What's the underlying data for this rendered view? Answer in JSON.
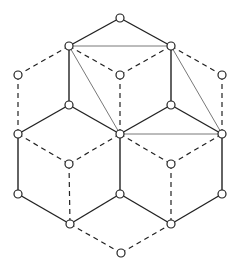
{
  "diagram": {
    "type": "graph",
    "node_radius": 4,
    "colors": {
      "stroke": "#222222",
      "thin_stroke": "#555555",
      "node_fill": "#ffffff",
      "background": "#ffffff"
    },
    "nodes": [
      {
        "id": 0,
        "x": 120,
        "y": 18
      },
      {
        "id": 1,
        "x": 69,
        "y": 46
      },
      {
        "id": 2,
        "x": 171,
        "y": 46
      },
      {
        "id": 3,
        "x": 18,
        "y": 75
      },
      {
        "id": 4,
        "x": 120,
        "y": 75
      },
      {
        "id": 5,
        "x": 222,
        "y": 75
      },
      {
        "id": 6,
        "x": 69,
        "y": 105
      },
      {
        "id": 7,
        "x": 171,
        "y": 105
      },
      {
        "id": 8,
        "x": 18,
        "y": 134
      },
      {
        "id": 9,
        "x": 120,
        "y": 134
      },
      {
        "id": 10,
        "x": 222,
        "y": 134
      },
      {
        "id": 11,
        "x": 69,
        "y": 164
      },
      {
        "id": 12,
        "x": 171,
        "y": 164
      },
      {
        "id": 13,
        "x": 18,
        "y": 194
      },
      {
        "id": 14,
        "x": 120,
        "y": 194
      },
      {
        "id": 15,
        "x": 222,
        "y": 194
      },
      {
        "id": 16,
        "x": 70,
        "y": 224
      },
      {
        "id": 17,
        "x": 171,
        "y": 224
      },
      {
        "id": 18,
        "x": 121,
        "y": 253
      }
    ],
    "edges": {
      "solid": [
        [
          0,
          1
        ],
        [
          0,
          2
        ],
        [
          1,
          6
        ],
        [
          2,
          7
        ],
        [
          8,
          6
        ],
        [
          6,
          9
        ],
        [
          9,
          7
        ],
        [
          7,
          10
        ],
        [
          8,
          13
        ],
        [
          13,
          16
        ],
        [
          16,
          14
        ],
        [
          14,
          9
        ],
        [
          14,
          17
        ],
        [
          17,
          15
        ],
        [
          15,
          10
        ]
      ],
      "thin": [
        [
          1,
          2
        ],
        [
          1,
          9
        ],
        [
          2,
          10
        ],
        [
          9,
          10
        ]
      ],
      "dashed": [
        [
          1,
          3
        ],
        [
          3,
          8
        ],
        [
          1,
          4
        ],
        [
          4,
          2
        ],
        [
          4,
          9
        ],
        [
          2,
          5
        ],
        [
          5,
          10
        ],
        [
          8,
          11
        ],
        [
          11,
          9
        ],
        [
          11,
          16
        ],
        [
          9,
          12
        ],
        [
          12,
          10
        ],
        [
          12,
          17
        ],
        [
          16,
          18
        ],
        [
          18,
          17
        ]
      ]
    }
  }
}
